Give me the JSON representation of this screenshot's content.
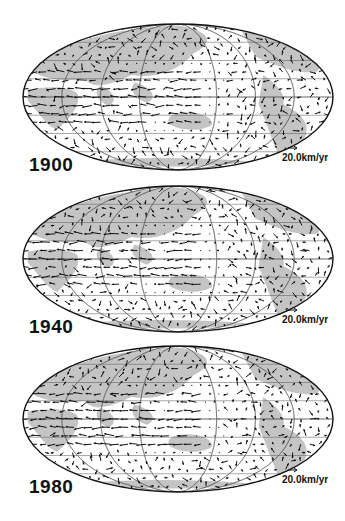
{
  "figure": {
    "projection": "Mollweide (equal-area) world map, Pacific-centred",
    "panels": [
      {
        "year": "1900",
        "scale_label": "20.0km/yr",
        "center_y": 97,
        "seed": 11
      },
      {
        "year": "1940",
        "scale_label": "20.0km/yr",
        "center_y": 259,
        "seed": 37
      },
      {
        "year": "1980",
        "scale_label": "20.0km/yr",
        "center_y": 419,
        "seed": 73
      }
    ],
    "colors": {
      "land": "#c4c4c4",
      "ocean": "#ffffff",
      "grid": "#555555",
      "arrow": "#111111",
      "outline": "#111111"
    }
  },
  "chart_data": {
    "type": "vector-field",
    "panels": [
      "1900",
      "1940",
      "1980"
    ],
    "scale_reference": "20.0km/yr",
    "features": "Strong westward flow along equatorial band beneath Atlantic/Africa; weak flow under Pacific; vectors drawn on regular lat-lon grid"
  }
}
